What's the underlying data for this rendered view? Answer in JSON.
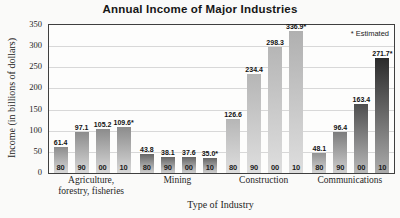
{
  "colors": {
    "background": "#fafaf9",
    "plot_background": "#fdfdfc",
    "plot_border": "#3f3f3f",
    "grid": "#d8d8d8",
    "title_text": "#161616",
    "label_text": "#232323",
    "value_text": "#111111"
  },
  "chart_data": {
    "type": "bar",
    "title": "Annual Income of Major Industries",
    "xlabel": "Type of Industry",
    "ylabel": "Income (in billions of dollars)",
    "ylim": [
      0,
      350
    ],
    "yticks": [
      0,
      50,
      100,
      150,
      200,
      250,
      300,
      350
    ],
    "grid": true,
    "legend": {
      "text": "* Estimated",
      "position": "top-right"
    },
    "year_categories": [
      "80",
      "90",
      "00",
      "10"
    ],
    "groups": [
      {
        "name": "Agriculture, forestry, fisheries",
        "label_lines": [
          "Agriculture,",
          "forestry, fisheries"
        ],
        "bars": [
          {
            "year": "80",
            "value": 61.4,
            "label": "61.4",
            "estimated": false,
            "fill_top": "#8c8c8c",
            "fill_bottom": "#d8d8d8"
          },
          {
            "year": "90",
            "value": 97.1,
            "label": "97.1",
            "estimated": false,
            "fill_top": "#8c8c8c",
            "fill_bottom": "#d8d8d8"
          },
          {
            "year": "00",
            "value": 105.2,
            "label": "105.2",
            "estimated": false,
            "fill_top": "#8c8c8c",
            "fill_bottom": "#d8d8d8"
          },
          {
            "year": "10",
            "value": 109.6,
            "label": "109.6*",
            "estimated": true,
            "fill_top": "#8c8c8c",
            "fill_bottom": "#d8d8d8"
          }
        ]
      },
      {
        "name": "Mining",
        "label_lines": [
          "Mining"
        ],
        "bars": [
          {
            "year": "80",
            "value": 43.8,
            "label": "43.8",
            "estimated": false,
            "fill_top": "#666666",
            "fill_bottom": "#cecece"
          },
          {
            "year": "90",
            "value": 38.1,
            "label": "38.1",
            "estimated": false,
            "fill_top": "#666666",
            "fill_bottom": "#cecece"
          },
          {
            "year": "00",
            "value": 37.6,
            "label": "37.6",
            "estimated": false,
            "fill_top": "#666666",
            "fill_bottom": "#cecece"
          },
          {
            "year": "10",
            "value": 35.0,
            "label": "35.0*",
            "estimated": true,
            "fill_top": "#666666",
            "fill_bottom": "#cecece"
          }
        ]
      },
      {
        "name": "Construction",
        "label_lines": [
          "Construction"
        ],
        "bars": [
          {
            "year": "80",
            "value": 126.6,
            "label": "126.6",
            "estimated": false,
            "fill_top": "#b6b6b6",
            "fill_bottom": "#dedede"
          },
          {
            "year": "90",
            "value": 234.4,
            "label": "234.4",
            "estimated": false,
            "fill_top": "#b6b6b6",
            "fill_bottom": "#dedede"
          },
          {
            "year": "00",
            "value": 298.3,
            "label": "298.3",
            "estimated": false,
            "fill_top": "#b6b6b6",
            "fill_bottom": "#dedede"
          },
          {
            "year": "10",
            "value": 336.9,
            "label": "336.9*",
            "estimated": true,
            "fill_top": "#b0b0b0",
            "fill_bottom": "#dedede"
          }
        ]
      },
      {
        "name": "Communications",
        "label_lines": [
          "Communications"
        ],
        "bars": [
          {
            "year": "80",
            "value": 48.1,
            "label": "48.1",
            "estimated": false,
            "fill_top": "#929292",
            "fill_bottom": "#d4d4d4"
          },
          {
            "year": "90",
            "value": 96.4,
            "label": "96.4",
            "estimated": false,
            "fill_top": "#7c7c7c",
            "fill_bottom": "#cfcfcf"
          },
          {
            "year": "00",
            "value": 163.4,
            "label": "163.4",
            "estimated": false,
            "fill_top": "#4e4e4e",
            "fill_bottom": "#b9b9b9"
          },
          {
            "year": "10",
            "value": 271.7,
            "label": "271.7*",
            "estimated": true,
            "fill_top": "#2b2b2b",
            "fill_bottom": "#ababab"
          }
        ]
      }
    ]
  }
}
